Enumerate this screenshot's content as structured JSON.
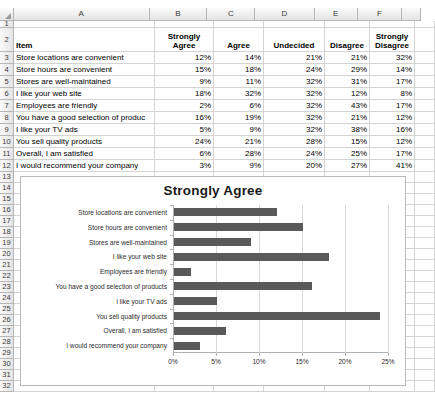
{
  "spreadsheet": {
    "column_headers": [
      "A",
      "B",
      "C",
      "D",
      "E",
      "F"
    ],
    "row_numbers": [
      "1",
      "2",
      "3",
      "4",
      "5",
      "6",
      "7",
      "8",
      "9",
      "10",
      "11",
      "12",
      "13",
      "14",
      "15",
      "16",
      "17",
      "18",
      "19",
      "20",
      "21",
      "22",
      "23",
      "24",
      "25",
      "26",
      "27",
      "28",
      "29",
      "30",
      "31",
      "32"
    ],
    "table_headers": {
      "item": "Item",
      "strongly_agree": "Strongly\nAgree",
      "strongly_agree_l1": "Strongly",
      "strongly_agree_l2": "Agree",
      "agree": "Agree",
      "undecided": "Undecided",
      "disagree": "Disagree",
      "strongly_disagree_l1": "Strongly",
      "strongly_disagree_l2": "Disagree"
    },
    "rows": [
      {
        "item": "Store locations are convenient",
        "strongly_agree": "12%",
        "agree": "14%",
        "undecided": "21%",
        "disagree": "21%",
        "strongly_disagree": "32%"
      },
      {
        "item": "Store hours are convenient",
        "strongly_agree": "15%",
        "agree": "18%",
        "undecided": "24%",
        "disagree": "29%",
        "strongly_disagree": "14%"
      },
      {
        "item": "Stores are well-maintained",
        "strongly_agree": "9%",
        "agree": "11%",
        "undecided": "32%",
        "disagree": "31%",
        "strongly_disagree": "17%"
      },
      {
        "item": "I like your web site",
        "strongly_agree": "18%",
        "agree": "32%",
        "undecided": "32%",
        "disagree": "12%",
        "strongly_disagree": "8%"
      },
      {
        "item": "Employees are friendly",
        "strongly_agree": "2%",
        "agree": "6%",
        "undecided": "32%",
        "disagree": "43%",
        "strongly_disagree": "17%"
      },
      {
        "item": "You have a good selection of produc",
        "strongly_agree": "16%",
        "agree": "19%",
        "undecided": "32%",
        "disagree": "21%",
        "strongly_disagree": "12%"
      },
      {
        "item": "I like your TV ads",
        "strongly_agree": "5%",
        "agree": "9%",
        "undecided": "32%",
        "disagree": "38%",
        "strongly_disagree": "16%"
      },
      {
        "item": "You sell quality products",
        "strongly_agree": "24%",
        "agree": "21%",
        "undecided": "28%",
        "disagree": "15%",
        "strongly_disagree": "12%"
      },
      {
        "item": "Overall, I am satisfied",
        "strongly_agree": "6%",
        "agree": "28%",
        "undecided": "24%",
        "disagree": "25%",
        "strongly_disagree": "17%"
      },
      {
        "item": "I would recommend your company",
        "strongly_agree": "3%",
        "agree": "9%",
        "undecided": "20%",
        "disagree": "27%",
        "strongly_disagree": "41%"
      }
    ]
  },
  "chart_data": {
    "type": "bar",
    "orientation": "horizontal",
    "title": "Strongly Agree",
    "xlabel": "",
    "ylabel": "",
    "xlim": [
      0,
      25
    ],
    "xticks": [
      "0%",
      "5%",
      "10%",
      "15%",
      "20%",
      "25%"
    ],
    "xtick_values": [
      0,
      5,
      10,
      15,
      20,
      25
    ],
    "grid": true,
    "legend": false,
    "bar_color": "#595959",
    "categories": [
      "Store locations are convenient",
      "Store hours are convenient",
      "Stores are well-maintained",
      "I like your web site",
      "Employees are friendly",
      "You have a good selection of products",
      "I like your TV ads",
      "You sell quality products",
      "Overall, I am satisfied",
      "I would recommend your company"
    ],
    "values": [
      12,
      15,
      9,
      18,
      2,
      16,
      5,
      24,
      6,
      3
    ]
  }
}
